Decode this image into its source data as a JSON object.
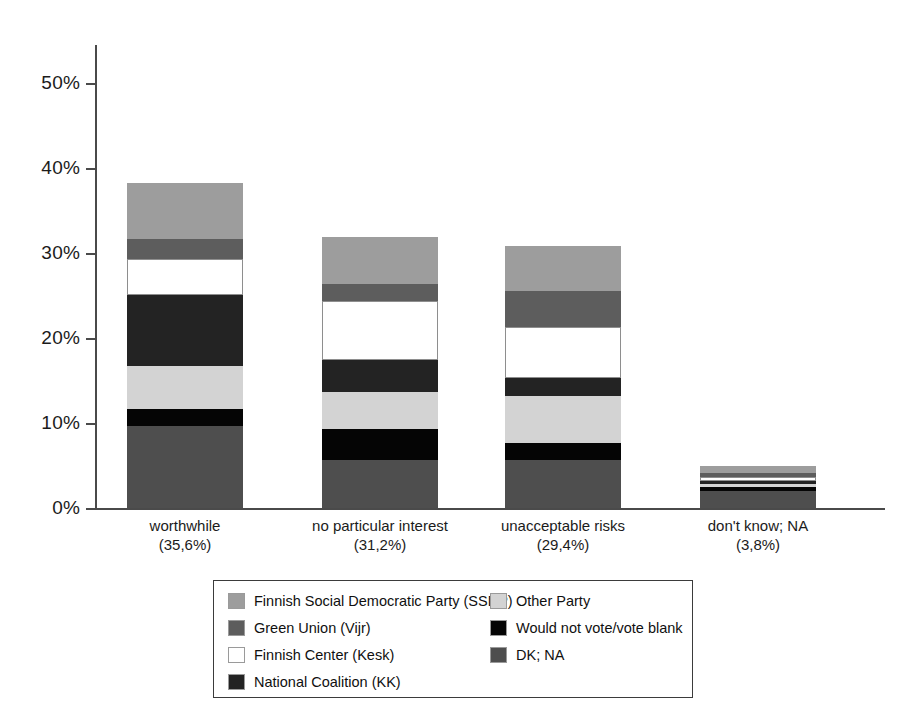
{
  "chart_data": {
    "type": "bar",
    "subtype": "stacked-bar",
    "title": "",
    "xlabel": "",
    "ylabel": "",
    "ylim": [
      0,
      50
    ],
    "y_tick_labels": [
      "0%",
      "10%",
      "20%",
      "30%",
      "40%",
      "50%"
    ],
    "y_ticks": [
      0,
      10,
      20,
      30,
      40,
      50
    ],
    "grid": false,
    "legend_position": "bottom",
    "categories": [
      "worthwhile",
      "no particular interest",
      "unacceptable risks",
      "don't know; NA"
    ],
    "category_totals_label": [
      "(35,6%)",
      "(31,2%)",
      "(29,4%)",
      "(3,8%)"
    ],
    "series": [
      {
        "name": "Finnish Social Democratic Party (SSDP)",
        "color": "#9d9d9d",
        "values": [
          6.6,
          5.5,
          5.3,
          0.8
        ]
      },
      {
        "name": "Green Union (Vijr)",
        "color": "#5d5d5d",
        "values": [
          2.3,
          2.1,
          4.2,
          0.4
        ]
      },
      {
        "name": "Finnish Center (Kesk)",
        "color": "#ffffff",
        "values": [
          4.2,
          6.9,
          6.0,
          0.5
        ]
      },
      {
        "name": "National Coalition (KK)",
        "color": "#232323",
        "values": [
          8.4,
          3.8,
          2.1,
          0.4
        ]
      },
      {
        "name": "Other Party",
        "color": "#d3d3d3",
        "values": [
          5.0,
          4.3,
          5.5,
          0.3
        ]
      },
      {
        "name": "Would not vote/vote blank",
        "color": "#050505",
        "values": [
          2.0,
          3.6,
          2.1,
          0.5
        ]
      },
      {
        "name": "DK; NA",
        "color": "#4e4e4e",
        "values": [
          9.7,
          5.7,
          5.6,
          2.0
        ]
      }
    ],
    "bar_totals": [
      38.2,
      31.9,
      30.8,
      4.9
    ]
  },
  "axis": {
    "ticks": [
      {
        "label": "50%",
        "value": 50
      },
      {
        "label": "40%",
        "value": 40
      },
      {
        "label": "30%",
        "value": 30
      },
      {
        "label": "20%",
        "value": 20
      },
      {
        "label": "10%",
        "value": 10
      },
      {
        "label": "0%",
        "value": 0
      }
    ]
  },
  "x_labels": [
    {
      "name": "worthwhile",
      "pct": "(35,6%)"
    },
    {
      "name": "no particular interest",
      "pct": "(31,2%)"
    },
    {
      "name": "unacceptable risks",
      "pct": "(29,4%)"
    },
    {
      "name": "don't know; NA",
      "pct": "(3,8%)"
    }
  ],
  "legend": {
    "left": [
      {
        "label": "Finnish Social Democratic Party (SSDP)",
        "color": "#9d9d9d"
      },
      {
        "label": "Green Union (Vijr)",
        "color": "#5d5d5d"
      },
      {
        "label": "Finnish Center (Kesk)",
        "color": "#ffffff"
      },
      {
        "label": "National Coalition (KK)",
        "color": "#232323"
      }
    ],
    "right": [
      {
        "label": "Other Party",
        "color": "#d3d3d3"
      },
      {
        "label": "Would not vote/vote blank",
        "color": "#050505"
      },
      {
        "label": "DK; NA",
        "color": "#4e4e4e"
      }
    ]
  }
}
